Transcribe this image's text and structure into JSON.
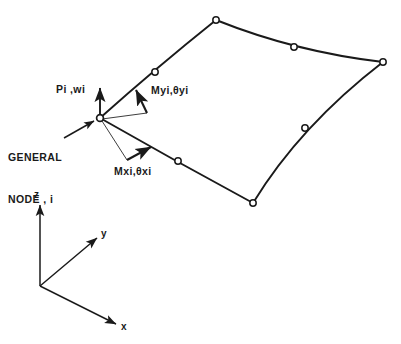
{
  "figure": {
    "background_color": "#ffffff",
    "line_color": "#1a1a1a",
    "node_fill_color": "#ffffff"
  },
  "labels": {
    "general_node_line1": "GENERAL",
    "general_node_line2": "NODE , i",
    "force_translation": "Pi ,wi",
    "moment_y": "Myi,θyi",
    "moment_x": "Mxi,θxi"
  },
  "axes": {
    "z_label": "z",
    "y_label": "y",
    "x_label": "x",
    "origin": {
      "x": 40,
      "y": 286
    },
    "z_tip": {
      "x": 40,
      "y": 202
    },
    "y_tip": {
      "x": 99,
      "y": 236
    },
    "x_tip": {
      "x": 118,
      "y": 325
    }
  },
  "element": {
    "node_radius": 3.2,
    "corner_nodes": [
      {
        "name": "general-node-i",
        "x": 100,
        "y": 118
      },
      {
        "name": "corner-node-top",
        "x": 216,
        "y": 20
      },
      {
        "name": "corner-node-right",
        "x": 383,
        "y": 62
      },
      {
        "name": "corner-node-bottom",
        "x": 253,
        "y": 203
      }
    ],
    "mid_nodes": [
      {
        "name": "mid-node-top-left",
        "x": 155,
        "y": 72
      },
      {
        "name": "mid-node-top-right",
        "x": 294,
        "y": 47
      },
      {
        "name": "mid-node-bottom-right",
        "x": 305,
        "y": 128
      },
      {
        "name": "mid-node-bottom-left",
        "x": 178,
        "y": 161
      }
    ],
    "edges": [
      {
        "name": "edge-top-left",
        "from": [
          100,
          118
        ],
        "ctrl": [
          156,
          68
        ],
        "to": [
          216,
          20
        ]
      },
      {
        "name": "edge-top-right",
        "from": [
          216,
          20
        ],
        "ctrl": [
          296,
          52
        ],
        "to": [
          383,
          62
        ]
      },
      {
        "name": "edge-bottom-right",
        "from": [
          383,
          62
        ],
        "ctrl": [
          300,
          126
        ],
        "to": [
          253,
          203
        ]
      },
      {
        "name": "edge-bottom-left",
        "from": [
          253,
          203
        ],
        "ctrl": [
          177,
          162
        ],
        "to": [
          100,
          118
        ]
      }
    ]
  },
  "vectors": {
    "p_arrow": {
      "name": "force-arrow-pi-wi",
      "from": [
        100,
        118
      ],
      "to": [
        100,
        86
      ]
    },
    "general_node_pointer": {
      "name": "general-node-leader",
      "from": [
        62,
        137
      ],
      "to": [
        95,
        120
      ]
    },
    "myi_leader": {
      "name": "moment-y-leader",
      "from": [
        100,
        119
      ],
      "to": [
        148,
        113
      ]
    },
    "myi_arrow": {
      "name": "moment-y-double-arrow",
      "from": [
        148,
        113
      ],
      "to": [
        135,
        88
      ]
    },
    "mxi_leader": {
      "name": "moment-x-leader",
      "from": [
        100,
        120
      ],
      "to": [
        128,
        160
      ]
    },
    "mxi_arrow": {
      "name": "moment-x-double-arrow",
      "from": [
        128,
        160
      ],
      "to": [
        152,
        146
      ]
    }
  }
}
